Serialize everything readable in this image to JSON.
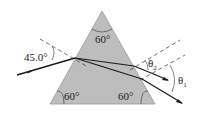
{
  "diagram": {
    "type": "prism-refraction",
    "prism": {
      "fill": "#bdbdbd",
      "stroke": "#888888",
      "angles": {
        "apex": "60°",
        "bottom_left": "60°",
        "bottom_right": "60°"
      }
    },
    "labels": {
      "incident_angle": "45.0°",
      "theta2": "θ",
      "theta2_sub": "2",
      "theta1": "θ",
      "theta1_sub": "1"
    },
    "colors": {
      "ray": "#1a1a1a",
      "dashed": "#333333"
    }
  }
}
